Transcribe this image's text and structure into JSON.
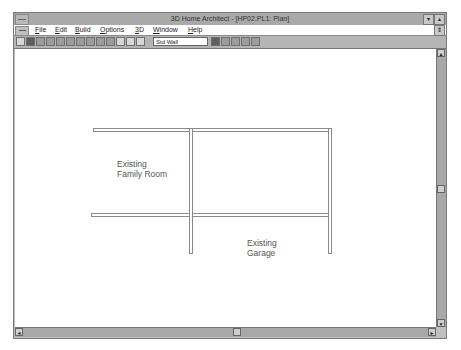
{
  "window": {
    "title": "3D Home Architect - [HP02.PL1: Plan]",
    "minimize_glyph": "▾",
    "maximize_glyph": "▴",
    "restore_glyph": "⇕"
  },
  "menu": {
    "items": [
      {
        "label": "File",
        "accel": "F"
      },
      {
        "label": "Edit",
        "accel": "E"
      },
      {
        "label": "Build",
        "accel": "B"
      },
      {
        "label": "Options",
        "accel": "O"
      },
      {
        "label": "3D",
        "accel": "3"
      },
      {
        "label": "Window",
        "accel": "W"
      },
      {
        "label": "Help",
        "accel": "H"
      }
    ]
  },
  "toolbar": {
    "wall_type_value": "Std Wall",
    "left_icons": [
      "select-icon",
      "wall-icon",
      "door-icon",
      "window-icon",
      "cabinet-icon",
      "fixture-icon",
      "furniture-icon",
      "electrical-icon",
      "stairs-icon",
      "roof-icon",
      "line-icon",
      "zoom-icon",
      "play-icon"
    ],
    "right_icons": [
      "fill-icon",
      "slope-icon",
      "pencil-icon",
      "dimension-icon",
      "text-icon"
    ]
  },
  "plan": {
    "rooms": [
      {
        "name_line1": "Existing",
        "name_line2": "Family Room"
      },
      {
        "name_line1": "Existing",
        "name_line2": "Garage"
      }
    ]
  },
  "scrollbars": {
    "up_glyph": "▲",
    "down_glyph": "▼",
    "left_glyph": "◄",
    "right_glyph": "►"
  }
}
